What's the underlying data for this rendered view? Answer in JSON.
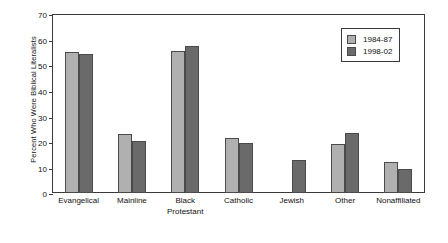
{
  "chart_data": {
    "type": "bar",
    "title": "",
    "xlabel": "",
    "ylabel": "Percent Who Were Biblical Literalists",
    "ylim": [
      0,
      70
    ],
    "yticks": [
      0,
      10,
      20,
      30,
      40,
      50,
      60,
      70
    ],
    "grid": false,
    "legend_position": "top-right",
    "categories": [
      "Evangelical",
      "Mainline",
      "Black Protestant",
      "Catholic",
      "Jewish",
      "Other",
      "Nonaffiliated"
    ],
    "category_lines": [
      [
        "Evangelical",
        ""
      ],
      [
        "Mainline",
        ""
      ],
      [
        "Black",
        "Protestant"
      ],
      [
        "Catholic",
        ""
      ],
      [
        "Jewish",
        ""
      ],
      [
        "Other",
        ""
      ],
      [
        "Nonaffiliated",
        ""
      ]
    ],
    "series": [
      {
        "name": "1984-87",
        "color": "#b0b0b0",
        "values": [
          55,
          23,
          55.5,
          21.5,
          0,
          19,
          12
        ]
      },
      {
        "name": "1998-02",
        "color": "#6a6a6a",
        "values": [
          54.5,
          20.5,
          57.5,
          19.5,
          13,
          23.5,
          9.5
        ]
      }
    ]
  },
  "legend": {
    "items": [
      {
        "label": "1984-87",
        "color": "#b0b0b0"
      },
      {
        "label": "1998-02",
        "color": "#6a6a6a"
      }
    ]
  },
  "axis": {
    "y_title": "Percent Who Were Biblical Literalists",
    "y_tick_labels": [
      "70",
      "60",
      "50",
      "40",
      "30",
      "20",
      "10",
      "0"
    ]
  }
}
